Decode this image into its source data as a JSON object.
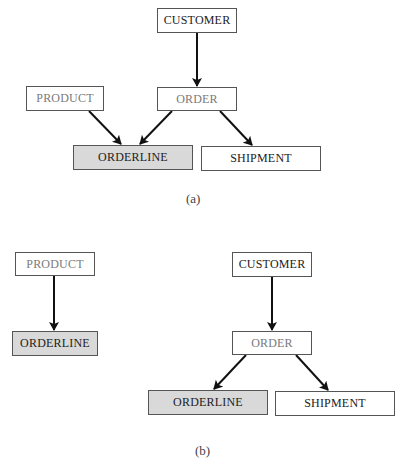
{
  "diagram_a": {
    "label": "(a)",
    "nodes": {
      "customer": "CUSTOMER",
      "product": "PRODUCT",
      "order": "ORDER",
      "orderline": "ORDERLINE",
      "shipment": "SHIPMENT"
    },
    "edges": [
      [
        "CUSTOMER",
        "ORDER"
      ],
      [
        "PRODUCT",
        "ORDERLINE"
      ],
      [
        "ORDER",
        "ORDERLINE"
      ],
      [
        "ORDER",
        "SHIPMENT"
      ]
    ]
  },
  "diagram_b": {
    "label": "(b)",
    "nodes": {
      "product": "PRODUCT",
      "orderline_left": "ORDERLINE",
      "customer": "CUSTOMER",
      "order": "ORDER",
      "orderline_right": "ORDERLINE",
      "shipment": "SHIPMENT"
    },
    "edges": [
      [
        "PRODUCT",
        "ORDERLINE"
      ],
      [
        "CUSTOMER",
        "ORDER"
      ],
      [
        "ORDER",
        "ORDERLINE"
      ],
      [
        "ORDER",
        "SHIPMENT"
      ]
    ]
  },
  "colors": {
    "box_border": "#555555",
    "shaded_fill": "#d9d9d9",
    "muted_text": "#7a7a7a",
    "arrow": "#111111"
  }
}
